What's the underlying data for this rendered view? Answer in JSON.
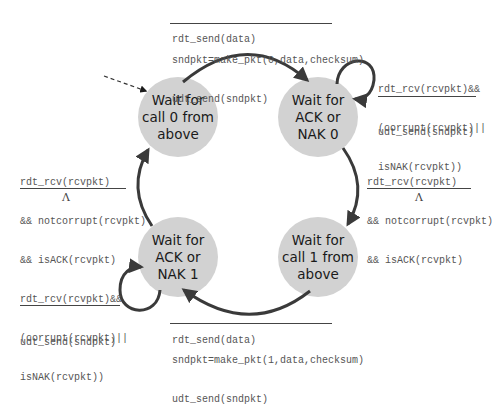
{
  "diagram": {
    "type": "finite-state-machine",
    "colors": {
      "state_fill": "#d2d2d2",
      "arrow": "#3a3a3a",
      "text_mono": "#555555",
      "text_state": "#1a1a1a"
    },
    "states": [
      {
        "id": "wait_call_0",
        "lines": [
          "Wait for",
          "call 0 from",
          "above"
        ],
        "initial": true
      },
      {
        "id": "wait_ack_0",
        "lines": [
          "Wait for",
          "ACK or",
          "NAK 0"
        ]
      },
      {
        "id": "wait_call_1",
        "lines": [
          "Wait for",
          "call 1 from",
          "above"
        ]
      },
      {
        "id": "wait_ack_1",
        "lines": [
          "Wait for",
          "ACK or",
          "NAK 1"
        ]
      }
    ],
    "transitions": [
      {
        "from": "wait_call_0",
        "to": "wait_ack_0",
        "event": [
          "rdt_send(data)"
        ],
        "actions": [
          "sndpkt=make_pkt(0,data,checksum)",
          "udt_send(sndpkt)"
        ]
      },
      {
        "from": "wait_ack_0",
        "to": "wait_ack_0",
        "event": [
          "rdt_rcv(rcvpkt)&&",
          "(corrupt(rcvpkt)||",
          "isNAK(rcvpkt))"
        ],
        "actions": [
          "udt_send(sndpkt)"
        ]
      },
      {
        "from": "wait_ack_0",
        "to": "wait_call_1",
        "event": [
          "rdt_rcv(rcvpkt)",
          "&& notcorrupt(rcvpkt)",
          "&& isACK(rcvpkt)"
        ],
        "actions": [
          "Λ"
        ]
      },
      {
        "from": "wait_call_1",
        "to": "wait_ack_1",
        "event": [
          "rdt_send(data)"
        ],
        "actions": [
          "sndpkt=make_pkt(1,data,checksum)",
          "udt_send(sndpkt)"
        ]
      },
      {
        "from": "wait_ack_1",
        "to": "wait_ack_1",
        "event": [
          "rdt_rcv(rcvpkt)&&",
          "(corrupt(rcvpkt)||",
          "isNAK(rcvpkt))"
        ],
        "actions": [
          "udt_send(sndpkt)"
        ]
      },
      {
        "from": "wait_ack_1",
        "to": "wait_call_0",
        "event": [
          "rdt_rcv(rcvpkt)",
          "&& notcorrupt(rcvpkt)",
          "&& isACK(rcvpkt)"
        ],
        "actions": [
          "Λ"
        ]
      }
    ]
  }
}
